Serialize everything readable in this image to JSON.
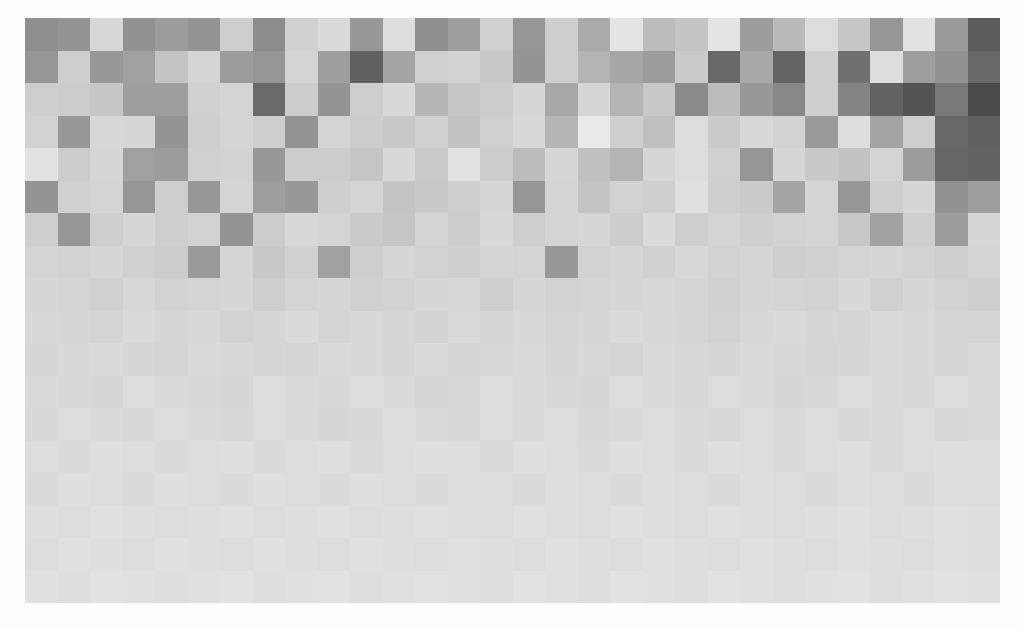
{
  "figure": {
    "background_color": "#fdfdfd",
    "plot_left": 25,
    "plot_top": 18,
    "plot_width": 975,
    "plot_height": 585
  },
  "chart_data": {
    "type": "heatmap",
    "title": "",
    "subtitle": "",
    "xlabel": "",
    "ylabel": "",
    "n_cols": 30,
    "n_rows": 18,
    "cell_width": 32.5,
    "cell_height": 32.5,
    "grid": false,
    "legend": null,
    "xticklabels": [],
    "yticklabels": [],
    "colormap": "gray",
    "vmin": 52,
    "vmax": 240,
    "value_unit": "gray level (0-255)",
    "values": [
      [
        142,
        148,
        215,
        146,
        156,
        148,
        206,
        140,
        208,
        218,
        152,
        222,
        142,
        158,
        208,
        150,
        206,
        170,
        228,
        188,
        196,
        228,
        156,
        186,
        220,
        198,
        150,
        226,
        154,
        92
      ],
      [
        150,
        206,
        152,
        160,
        196,
        212,
        156,
        150,
        212,
        158,
        96,
        164,
        208,
        210,
        200,
        148,
        206,
        180,
        166,
        156,
        202,
        104,
        168,
        100,
        206,
        112,
        220,
        158,
        146,
        104
      ],
      [
        206,
        204,
        198,
        158,
        158,
        208,
        212,
        106,
        204,
        148,
        206,
        216,
        182,
        198,
        204,
        214,
        168,
        214,
        180,
        200,
        138,
        188,
        152,
        136,
        206,
        132,
        98,
        84,
        120,
        74
      ],
      [
        210,
        152,
        216,
        214,
        148,
        206,
        212,
        206,
        148,
        212,
        204,
        200,
        208,
        194,
        208,
        216,
        182,
        234,
        206,
        192,
        220,
        202,
        216,
        210,
        154,
        222,
        164,
        206,
        104,
        96
      ],
      [
        226,
        204,
        214,
        160,
        156,
        208,
        210,
        152,
        204,
        204,
        198,
        216,
        202,
        226,
        204,
        188,
        214,
        192,
        180,
        214,
        220,
        208,
        150,
        214,
        200,
        194,
        212,
        156,
        102,
        98
      ],
      [
        148,
        208,
        212,
        150,
        206,
        150,
        212,
        158,
        152,
        206,
        212,
        196,
        200,
        206,
        214,
        150,
        212,
        196,
        210,
        206,
        224,
        206,
        202,
        164,
        212,
        150,
        206,
        214,
        146,
        158
      ],
      [
        206,
        150,
        206,
        214,
        206,
        210,
        148,
        204,
        216,
        212,
        202,
        198,
        212,
        204,
        216,
        206,
        212,
        214,
        204,
        218,
        206,
        212,
        206,
        210,
        212,
        200,
        162,
        206,
        156,
        214
      ],
      [
        212,
        210,
        214,
        208,
        204,
        154,
        214,
        200,
        208,
        160,
        206,
        214,
        210,
        206,
        214,
        212,
        152,
        210,
        214,
        208,
        216,
        210,
        214,
        206,
        208,
        212,
        214,
        210,
        206,
        212
      ],
      [
        214,
        212,
        208,
        216,
        210,
        212,
        214,
        206,
        212,
        214,
        208,
        210,
        214,
        216,
        206,
        214,
        210,
        212,
        214,
        216,
        212,
        208,
        214,
        212,
        210,
        216,
        208,
        214,
        210,
        206
      ],
      [
        216,
        214,
        212,
        218,
        214,
        216,
        210,
        214,
        218,
        212,
        216,
        214,
        210,
        218,
        214,
        216,
        212,
        214,
        218,
        216,
        214,
        210,
        216,
        218,
        214,
        212,
        218,
        216,
        214,
        212
      ],
      [
        214,
        216,
        218,
        214,
        212,
        218,
        216,
        214,
        212,
        218,
        216,
        214,
        218,
        212,
        216,
        218,
        214,
        216,
        212,
        218,
        216,
        214,
        218,
        216,
        212,
        214,
        218,
        216,
        214,
        218
      ],
      [
        218,
        216,
        214,
        220,
        218,
        216,
        214,
        220,
        218,
        216,
        220,
        218,
        214,
        216,
        220,
        218,
        216,
        214,
        220,
        218,
        216,
        220,
        218,
        214,
        216,
        220,
        218,
        216,
        220,
        218
      ],
      [
        216,
        220,
        218,
        216,
        220,
        218,
        216,
        220,
        218,
        214,
        216,
        220,
        218,
        216,
        220,
        218,
        220,
        216,
        218,
        220,
        218,
        216,
        220,
        218,
        220,
        216,
        218,
        220,
        216,
        218
      ],
      [
        220,
        218,
        222,
        220,
        218,
        220,
        222,
        218,
        220,
        222,
        218,
        220,
        222,
        220,
        218,
        222,
        220,
        218,
        222,
        220,
        218,
        222,
        220,
        218,
        220,
        222,
        218,
        220,
        222,
        220
      ],
      [
        218,
        222,
        220,
        218,
        222,
        220,
        218,
        222,
        220,
        218,
        222,
        220,
        218,
        222,
        220,
        218,
        222,
        220,
        218,
        222,
        220,
        218,
        222,
        220,
        218,
        222,
        220,
        218,
        222,
        220
      ],
      [
        222,
        220,
        224,
        222,
        220,
        222,
        224,
        220,
        222,
        224,
        220,
        222,
        224,
        222,
        220,
        224,
        222,
        220,
        224,
        222,
        220,
        224,
        222,
        220,
        222,
        224,
        220,
        222,
        224,
        222
      ],
      [
        220,
        224,
        222,
        220,
        224,
        222,
        220,
        224,
        222,
        220,
        224,
        222,
        220,
        224,
        222,
        220,
        224,
        222,
        220,
        224,
        222,
        220,
        224,
        222,
        220,
        224,
        222,
        220,
        224,
        222
      ],
      [
        224,
        222,
        226,
        224,
        222,
        224,
        226,
        222,
        224,
        226,
        222,
        224,
        226,
        224,
        222,
        226,
        224,
        222,
        226,
        224,
        222,
        226,
        224,
        222,
        224,
        226,
        222,
        224,
        226,
        224
      ]
    ]
  }
}
